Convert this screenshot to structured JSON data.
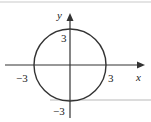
{
  "diagram": {
    "type": "circle-graph",
    "equation_implied": "x^2 + y^2 = 9",
    "center": [
      0,
      0
    ],
    "radius": 3,
    "axes": {
      "x_label": "x",
      "y_label": "y"
    },
    "tick_labels": {
      "x_neg": "−3",
      "x_pos": "3",
      "y_pos": "3",
      "y_neg": "−3"
    }
  }
}
